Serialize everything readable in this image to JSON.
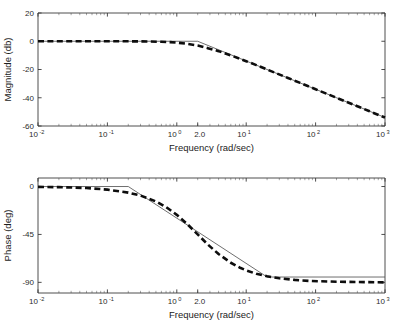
{
  "figure": {
    "name": "bode-plot",
    "background_color": "#ffffff",
    "panels": [
      "magnitude",
      "phase"
    ]
  },
  "chart_data": [
    {
      "type": "line",
      "name": "magnitude",
      "title": "",
      "xlabel": "Frequency (rad/sec)",
      "ylabel": "Magnitude (db)",
      "xscale": "log",
      "xlim": [
        0.01,
        1000
      ],
      "ylim": [
        -60,
        20
      ],
      "yticks": [
        20,
        0,
        -20,
        -40,
        -60
      ],
      "ytick_labels": [
        "20",
        "0",
        "-20",
        "-40",
        "-60"
      ],
      "xticks": [
        0.01,
        0.1,
        1,
        10,
        100,
        1000
      ],
      "xtick_labels": [
        "10",
        "10",
        "10",
        "10",
        "10",
        "10"
      ],
      "xtick_exponents": [
        "-2",
        "-1",
        "0",
        "1",
        "2",
        "3"
      ],
      "extra_xtick": {
        "value": 2.0,
        "label": "2.0"
      },
      "grid": false,
      "corner_frequency": 2.0,
      "series": [
        {
          "name": "asymptotic approximation",
          "style": "solid-thin",
          "color": "#555555",
          "x": [
            0.01,
            2.0,
            1000
          ],
          "y": [
            0,
            0,
            -54
          ]
        },
        {
          "name": "actual response",
          "style": "dashed-thick",
          "color": "#0d0d0d",
          "x": [
            0.01,
            0.02,
            0.05,
            0.1,
            0.2,
            0.4,
            0.6,
            0.8,
            1.0,
            1.4,
            2.0,
            2.8,
            4.0,
            6.0,
            8.0,
            10,
            14,
            20,
            40,
            60,
            100,
            200,
            400,
            600,
            1000
          ],
          "y": [
            0.0,
            0.0,
            0.0,
            -0.01,
            -0.04,
            -0.17,
            -0.38,
            -0.65,
            -0.97,
            -1.8,
            -3.0,
            -4.9,
            -7.0,
            -10.0,
            -12.3,
            -14.1,
            -16.9,
            -20.0,
            -26.0,
            -29.5,
            -34.0,
            -40.0,
            -46.0,
            -49.6,
            -54.0
          ]
        }
      ]
    },
    {
      "type": "line",
      "name": "phase",
      "title": "",
      "xlabel": "Frequency (rad/sec)",
      "ylabel": "Phase (deg)",
      "xscale": "log",
      "xlim": [
        0.01,
        1000
      ],
      "ylim": [
        -100,
        8
      ],
      "yticks": [
        0,
        -45,
        -90
      ],
      "ytick_labels": [
        "0",
        "-45",
        "-90"
      ],
      "xticks": [
        0.01,
        0.1,
        1,
        10,
        100,
        1000
      ],
      "xtick_labels": [
        "10",
        "10",
        "10",
        "10",
        "10",
        "10"
      ],
      "xtick_exponents": [
        "-2",
        "-1",
        "0",
        "1",
        "2",
        "3"
      ],
      "extra_xtick": {
        "value": 2.0,
        "label": "2.0"
      },
      "grid": false,
      "corner_frequency": 2.0,
      "series": [
        {
          "name": "asymptotic approximation",
          "style": "solid-thin",
          "color": "#555555",
          "x": [
            0.01,
            0.2,
            20,
            1000
          ],
          "y": [
            0,
            0,
            -85,
            -85
          ]
        },
        {
          "name": "actual response",
          "style": "dashed-thick",
          "color": "#0d0d0d",
          "x": [
            0.01,
            0.02,
            0.05,
            0.1,
            0.2,
            0.3,
            0.5,
            0.7,
            1.0,
            1.4,
            2.0,
            2.8,
            4.0,
            6.0,
            8.0,
            10,
            14,
            20,
            30,
            50,
            80,
            120,
            200,
            400,
            700,
            1000
          ],
          "y": [
            -0.3,
            -0.6,
            -1.4,
            -2.9,
            -5.7,
            -8.5,
            -14.0,
            -19.3,
            -26.6,
            -35.0,
            -45.0,
            -54.5,
            -63.4,
            -71.6,
            -76.0,
            -78.7,
            -82.0,
            -84.3,
            -86.2,
            -87.7,
            -88.6,
            -89.0,
            -89.4,
            -89.7,
            -89.9,
            -90.0
          ]
        }
      ]
    }
  ]
}
